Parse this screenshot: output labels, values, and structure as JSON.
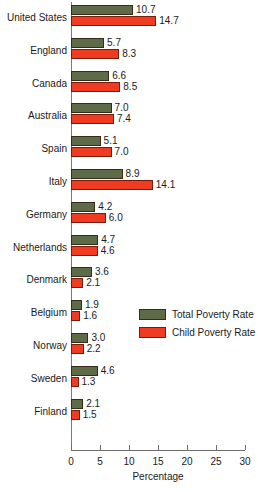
{
  "chart_data": {
    "type": "bar",
    "orientation": "horizontal",
    "title": "",
    "xlabel": "Percentage",
    "ylabel": "",
    "xlim": [
      0,
      30
    ],
    "xticks": [
      0,
      5,
      10,
      15,
      20,
      25,
      30
    ],
    "xtick_labels": [
      "0",
      "5",
      "10",
      "15",
      "20",
      "25",
      "30"
    ],
    "grid": false,
    "legend_position": "center-right",
    "categories": [
      "United States",
      "England",
      "Canada",
      "Australia",
      "Spain",
      "Italy",
      "Germany",
      "Netherlands",
      "Denmark",
      "Belgium",
      "Norway",
      "Sweden",
      "Finland"
    ],
    "series": [
      {
        "name": "Total Poverty Rate",
        "color": "#5d6b48",
        "values": [
          10.7,
          5.7,
          6.6,
          7.0,
          5.1,
          8.9,
          4.2,
          4.7,
          3.6,
          1.9,
          3.0,
          4.6,
          2.1
        ],
        "value_labels": [
          "10.7",
          "5.7",
          "6.6",
          "7.0",
          "5.1",
          "8.9",
          "4.2",
          "4.7",
          "3.6",
          "1.9",
          "3.0",
          "4.6",
          "2.1"
        ]
      },
      {
        "name": "Child Poverty Rate",
        "color": "#ee3b22",
        "values": [
          14.7,
          8.3,
          8.5,
          7.4,
          7.0,
          14.1,
          6.0,
          4.6,
          2.1,
          1.6,
          2.2,
          1.3,
          1.5
        ],
        "value_labels": [
          "14.7",
          "8.3",
          "8.5",
          "7.4",
          "7.0",
          "14.1",
          "6.0",
          "4.6",
          "2.1",
          "1.6",
          "2.2",
          "1.3",
          "1.5"
        ]
      }
    ]
  },
  "legend": {
    "items": [
      {
        "label": "Total Poverty Rate",
        "key": "total"
      },
      {
        "label": "Child Poverty Rate",
        "key": "child"
      }
    ]
  },
  "axis": {
    "x_title": "Percentage"
  }
}
